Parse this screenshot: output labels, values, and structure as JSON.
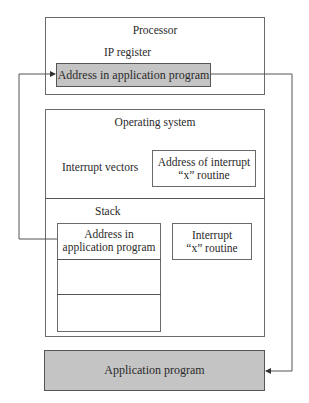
{
  "diagram": {
    "processor": {
      "title": "Processor",
      "register_label": "IP register",
      "register_value": "Address in application program"
    },
    "operating_system": {
      "title": "Operating system",
      "interrupt_vectors_label": "Interrupt vectors",
      "interrupt_vector_entry_line1": "Address of interrupt",
      "interrupt_vector_entry_line2": "“x” routine",
      "stack_label": "Stack",
      "stack_top_line1": "Address in",
      "stack_top_line2": "application program",
      "routine_line1": "Interrupt",
      "routine_line2": "“x” routine"
    },
    "application": {
      "title": "Application program"
    },
    "colors": {
      "highlight_fill": "#c4c4c4",
      "line": "#555555"
    }
  }
}
